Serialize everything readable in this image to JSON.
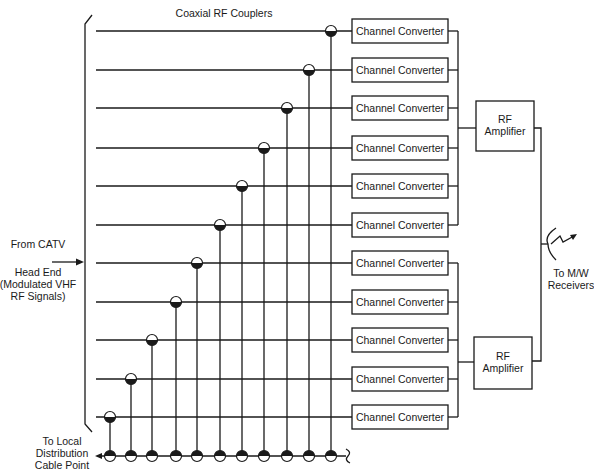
{
  "title": "Coaxial RF Couplers",
  "input": {
    "line1": "From CATV",
    "line2": "Head End",
    "line3": "(Modulated VHF",
    "line4": "RF Signals)"
  },
  "output": {
    "line1": "To M/W",
    "line2": "Receivers"
  },
  "local": {
    "line1": "To Local",
    "line2": "Distribution",
    "line3": "Cable Point"
  },
  "converter_label": "Channel Converter",
  "amplifier": {
    "line1": "RF",
    "line2": "Amplifier"
  },
  "channels": [
    {
      "y": 31,
      "coupler_x": 331,
      "label": "Channel Converter",
      "group": "upper"
    },
    {
      "y": 70,
      "coupler_x": 309,
      "label": "Channel Converter",
      "group": "upper"
    },
    {
      "y": 108,
      "coupler_x": 287,
      "label": "Channel Converter",
      "group": "upper"
    },
    {
      "y": 148,
      "coupler_x": 264,
      "label": "Channel Converter",
      "group": "upper"
    },
    {
      "y": 186,
      "coupler_x": 242,
      "label": "Channel Converter",
      "group": "upper"
    },
    {
      "y": 225,
      "coupler_x": 220,
      "label": "Channel Converter",
      "group": "upper"
    },
    {
      "y": 263,
      "coupler_x": 197,
      "label": "Channel Converter",
      "group": "lower"
    },
    {
      "y": 302,
      "coupler_x": 176,
      "label": "Channel Converter",
      "group": "lower"
    },
    {
      "y": 340,
      "coupler_x": 152,
      "label": "Channel Converter",
      "group": "lower"
    },
    {
      "y": 379,
      "coupler_x": 131,
      "label": "Channel Converter",
      "group": "lower"
    },
    {
      "y": 417,
      "coupler_x": 110,
      "label": "Channel Converter",
      "group": "lower"
    }
  ]
}
